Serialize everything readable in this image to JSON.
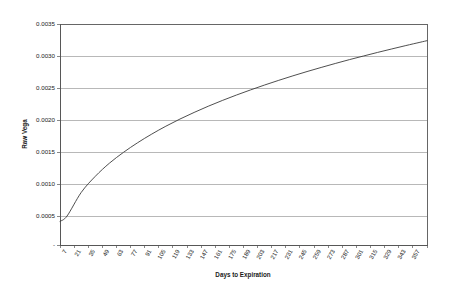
{
  "chart_data": {
    "type": "line",
    "title": "",
    "xlabel": "Days to Expiration",
    "ylabel": "Raw Vega",
    "xlim": [
      7,
      371
    ],
    "ylim": [
      0,
      0.0035
    ],
    "grid": true,
    "legend": false,
    "y_ticks": [
      "0.0035",
      "0.0030",
      "0.0025",
      "0.0020",
      "0.0015",
      "0.0010",
      "0.0005",
      "-"
    ],
    "y_tick_values": [
      0.0035,
      0.003,
      0.0025,
      0.002,
      0.0015,
      0.001,
      0.0005,
      0.0
    ],
    "categories": [
      "7",
      "21",
      "35",
      "49",
      "63",
      "77",
      "91",
      "105",
      "119",
      "133",
      "147",
      "161",
      "175",
      "189",
      "203",
      "217",
      "231",
      "245",
      "259",
      "273",
      "287",
      "301",
      "315",
      "329",
      "343",
      "357"
    ],
    "series": [
      {
        "name": "Raw Vega",
        "values": [
          0.0005,
          0.000867,
          0.00112,
          0.001325,
          0.001495,
          0.001645,
          0.00178,
          0.001903,
          0.002015,
          0.002118,
          0.002215,
          0.002305,
          0.00239,
          0.00247,
          0.002547,
          0.00262,
          0.00269,
          0.002757,
          0.002821,
          0.002883,
          0.002943,
          0.003,
          0.003056,
          0.00311,
          0.003163,
          0.003214
        ]
      }
    ]
  }
}
